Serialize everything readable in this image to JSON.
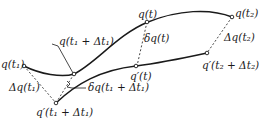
{
  "diagram": {
    "type": "variation-of-trajectory",
    "colors": {
      "stroke": "#1a1a1a",
      "background": "#ffffff"
    },
    "curves": [
      {
        "id": "actual-path",
        "from": "q(t₁)",
        "through": "q(t)",
        "to": "q(t₂)"
      },
      {
        "id": "varied-path",
        "from": "q′(t₁ + Δt₁)",
        "through": "q′(t)",
        "to": "q′(t₂ + Δt₂)"
      }
    ],
    "labels": {
      "q_t1": "q(t₁)",
      "q_t1_dt1": "q(t₁ + Δt₁)",
      "q_t": "q(t)",
      "q_t2": "q(t₂)",
      "delta_q_t": "δq(t)",
      "qp_t": "q′(t)",
      "Delta_q_t2": "Δq(t₂)",
      "qp_t2_dt2": "q′(t₂ + Δt₂)",
      "Delta_q_t1": "Δq(t₁)",
      "delta_q_t1_dt1": "δq(t₁ + Δt₁)",
      "qp_t1_dt1": "q′(t₁ + Δt₁)"
    },
    "connectors": [
      {
        "from": "q(t₁)",
        "to": "q′(t₁ + Δt₁)",
        "style": "dashed",
        "label": "Δq(t₁)"
      },
      {
        "from": "q(t)",
        "to": "q′(t)",
        "style": "dashed",
        "label": "δq(t)"
      },
      {
        "from": "q(t₂)",
        "to": "q′(t₂ + Δt₂)",
        "style": "dashed",
        "label": "Δq(t₂)"
      },
      {
        "from": "q(t₁ + Δt₁)",
        "to": "q′(t₁ + Δt₁)",
        "style": "dashed",
        "label": "δq(t₁ + Δt₁)"
      }
    ]
  }
}
